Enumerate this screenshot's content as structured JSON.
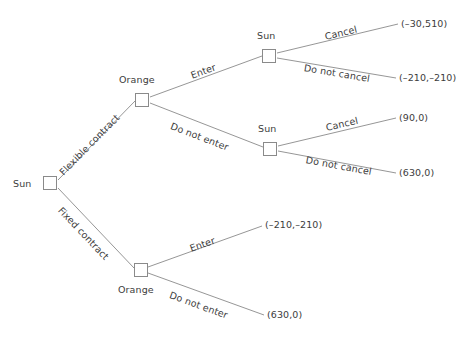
{
  "diagram": {
    "type": "extensive-form-game-tree",
    "line_color": "#8a8a8a",
    "text_color": "#3c3c3c",
    "background": "#ffffff"
  },
  "nodes": [
    {
      "id": "root",
      "player": "Sun",
      "label_position": "left"
    },
    {
      "id": "orange-top",
      "player": "Orange",
      "label_position": "above"
    },
    {
      "id": "sun-top",
      "player": "Sun",
      "label_position": "above"
    },
    {
      "id": "sun-mid",
      "player": "Sun",
      "label_position": "above"
    },
    {
      "id": "orange-bottom",
      "player": "Orange",
      "label_position": "below"
    }
  ],
  "edges": [
    {
      "id": "e-flexible",
      "label": "Flexible contract"
    },
    {
      "id": "e-fixed",
      "label": "Fixed contract"
    },
    {
      "id": "e-enter-top",
      "label": "Enter"
    },
    {
      "id": "e-do-not-enter-top",
      "label": "Do not enter"
    },
    {
      "id": "e-cancel-top",
      "label": "Cancel"
    },
    {
      "id": "e-do-not-cancel-top",
      "label": "Do not cancel"
    },
    {
      "id": "e-cancel-mid",
      "label": "Cancel"
    },
    {
      "id": "e-do-not-cancel-mid",
      "label": "Do not cancel"
    },
    {
      "id": "e-enter-bottom",
      "label": "Enter"
    },
    {
      "id": "e-do-not-enter-bottom",
      "label": "Do not enter"
    }
  ],
  "payoffs": [
    {
      "id": "p1",
      "text": "(–30,510)",
      "path": "Flexible contract → Enter → Cancel"
    },
    {
      "id": "p2",
      "text": "(–210,–210)",
      "path": "Flexible contract → Enter → Do not cancel"
    },
    {
      "id": "p3",
      "text": "(90,0)",
      "path": "Flexible contract → Do not enter → Cancel"
    },
    {
      "id": "p4",
      "text": "(630,0)",
      "path": "Flexible contract → Do not enter → Do not cancel"
    },
    {
      "id": "p5",
      "text": "(–210,–210)",
      "path": "Fixed contract → Enter"
    },
    {
      "id": "p6",
      "text": "(630,0)",
      "path": "Fixed contract → Do not enter"
    }
  ]
}
